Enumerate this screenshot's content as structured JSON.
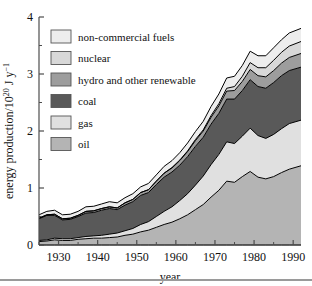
{
  "figure": {
    "background": "#ffffff",
    "axis_color": "#4d4d4d",
    "line_color": "#000000"
  },
  "axes": {
    "x": {
      "title": "year",
      "ticks": [
        1930,
        1940,
        1950,
        1960,
        1970,
        1980,
        1990
      ],
      "tick_labels": [
        "1930",
        "1940",
        "1950",
        "1960",
        "1970",
        "1980",
        "1990"
      ],
      "range": [
        1925,
        1992
      ],
      "minor_tick_step": 5
    },
    "y": {
      "title_parts": {
        "main": "energy production/10",
        "exp1": "20",
        "mid": " J y",
        "exp2": "−1"
      },
      "title_plain": "energy production/10^20 J y^-1",
      "ticks": [
        0,
        1,
        2,
        3,
        4
      ],
      "tick_labels": [
        "0",
        "1",
        "2",
        "3",
        "4"
      ],
      "range": [
        0,
        4
      ],
      "minor_tick_step": 0.5
    },
    "grid": false
  },
  "legend": {
    "position": "upper-left-inside",
    "entries": [
      {
        "label": "non-commercial fuels",
        "color": "#ededed"
      },
      {
        "label": "nuclear",
        "color": "#d8d8d8"
      },
      {
        "label": "hydro and other renewable",
        "color": "#9d9d9d"
      },
      {
        "label": "coal",
        "color": "#595959"
      },
      {
        "label": "gas",
        "color": "#e0e0e0"
      },
      {
        "label": "oil",
        "color": "#b4b4b4"
      }
    ]
  },
  "chart_data": {
    "type": "area",
    "stacked": true,
    "title": "",
    "xlabel": "year",
    "ylabel": "energy production/10^20 J y^-1",
    "xlim": [
      1925,
      1992
    ],
    "ylim": [
      0,
      4
    ],
    "grid": false,
    "legend_position": "upper-left-inside",
    "stack_order_bottom_to_top": [
      "oil",
      "gas",
      "coal",
      "hydro and other renewable",
      "nuclear",
      "non-commercial fuels"
    ],
    "x": [
      1925,
      1927,
      1929,
      1931,
      1933,
      1935,
      1937,
      1939,
      1941,
      1943,
      1945,
      1947,
      1949,
      1951,
      1953,
      1955,
      1957,
      1959,
      1961,
      1963,
      1965,
      1967,
      1969,
      1971,
      1973,
      1975,
      1977,
      1979,
      1981,
      1983,
      1985,
      1987,
      1989,
      1992
    ],
    "series": [
      {
        "name": "oil",
        "color": "#b4b4b4",
        "values": [
          0.06,
          0.07,
          0.09,
          0.08,
          0.08,
          0.1,
          0.11,
          0.12,
          0.12,
          0.13,
          0.14,
          0.17,
          0.19,
          0.23,
          0.26,
          0.31,
          0.36,
          0.4,
          0.46,
          0.53,
          0.62,
          0.71,
          0.84,
          0.96,
          1.12,
          1.1,
          1.2,
          1.29,
          1.19,
          1.16,
          1.2,
          1.27,
          1.33,
          1.39
        ]
      },
      {
        "name": "gas",
        "color": "#e0e0e0",
        "values": [
          0.02,
          0.02,
          0.03,
          0.03,
          0.03,
          0.03,
          0.04,
          0.04,
          0.05,
          0.06,
          0.07,
          0.08,
          0.1,
          0.13,
          0.15,
          0.19,
          0.23,
          0.27,
          0.32,
          0.37,
          0.43,
          0.5,
          0.57,
          0.63,
          0.69,
          0.68,
          0.71,
          0.76,
          0.73,
          0.71,
          0.74,
          0.77,
          0.8,
          0.8
        ]
      },
      {
        "name": "coal",
        "color": "#595959",
        "values": [
          0.38,
          0.43,
          0.4,
          0.33,
          0.34,
          0.37,
          0.41,
          0.41,
          0.44,
          0.45,
          0.41,
          0.45,
          0.47,
          0.51,
          0.51,
          0.56,
          0.6,
          0.61,
          0.62,
          0.65,
          0.68,
          0.68,
          0.71,
          0.72,
          0.75,
          0.78,
          0.8,
          0.85,
          0.86,
          0.88,
          0.91,
          0.93,
          0.93,
          0.93
        ]
      },
      {
        "name": "hydro and other renewable",
        "color": "#9d9d9d",
        "values": [
          0.01,
          0.01,
          0.02,
          0.02,
          0.02,
          0.02,
          0.03,
          0.03,
          0.03,
          0.03,
          0.03,
          0.04,
          0.04,
          0.05,
          0.05,
          0.06,
          0.07,
          0.07,
          0.08,
          0.09,
          0.1,
          0.11,
          0.12,
          0.13,
          0.14,
          0.15,
          0.16,
          0.18,
          0.19,
          0.2,
          0.21,
          0.22,
          0.23,
          0.24
        ]
      },
      {
        "name": "nuclear",
        "color": "#d8d8d8",
        "values": [
          0.0,
          0.0,
          0.0,
          0.0,
          0.0,
          0.0,
          0.0,
          0.0,
          0.0,
          0.0,
          0.0,
          0.0,
          0.0,
          0.0,
          0.0,
          0.0,
          0.0,
          0.01,
          0.01,
          0.01,
          0.02,
          0.02,
          0.03,
          0.04,
          0.05,
          0.07,
          0.09,
          0.12,
          0.14,
          0.16,
          0.18,
          0.19,
          0.2,
          0.21
        ]
      },
      {
        "name": "non-commercial fuels",
        "color": "#ededed",
        "values": [
          0.06,
          0.06,
          0.07,
          0.07,
          0.07,
          0.07,
          0.08,
          0.08,
          0.08,
          0.09,
          0.09,
          0.09,
          0.1,
          0.1,
          0.11,
          0.11,
          0.12,
          0.12,
          0.13,
          0.14,
          0.14,
          0.15,
          0.16,
          0.17,
          0.18,
          0.18,
          0.19,
          0.2,
          0.21,
          0.21,
          0.22,
          0.22,
          0.23,
          0.23
        ]
      }
    ]
  }
}
